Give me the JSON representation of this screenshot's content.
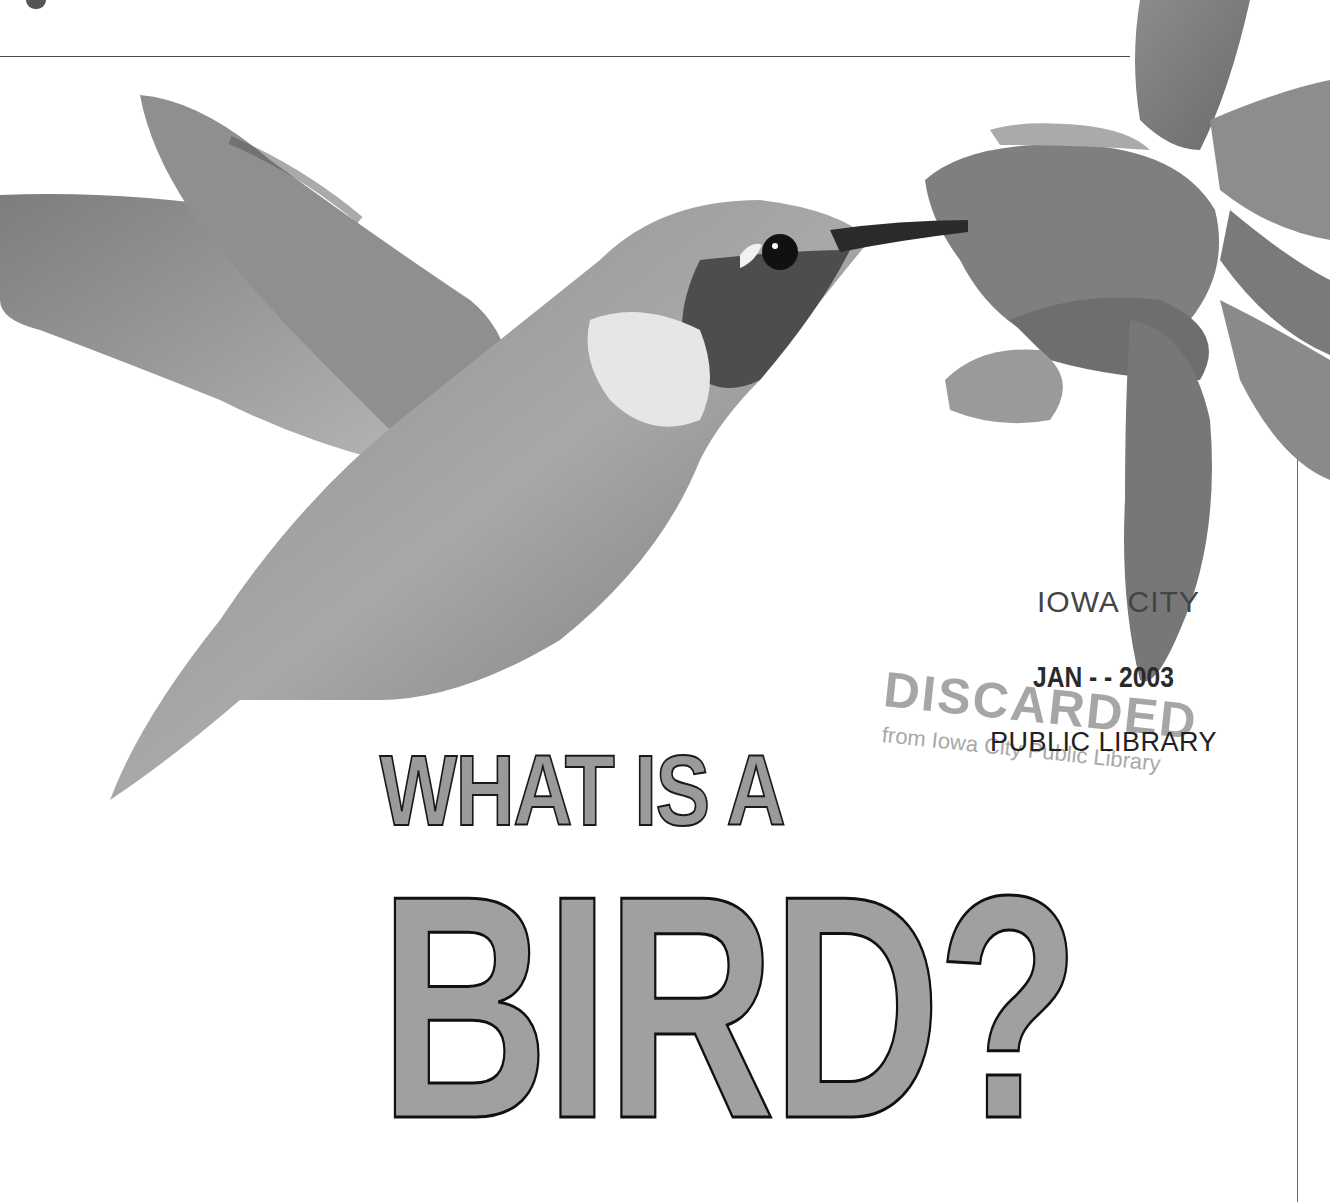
{
  "page": {
    "type": "book-cover",
    "background": "#ffffff"
  },
  "title": {
    "line1": "WHAT IS A",
    "line2": "BIRD?",
    "fill_color": "#9e9e9e",
    "outline_color": "#111111"
  },
  "illustration": {
    "subject": "hummingbird feeding from a flower",
    "elements": [
      "hummingbird",
      "flower"
    ]
  },
  "stamps": {
    "library_city": "IOWA CITY",
    "date": "JAN - - 2003",
    "library_name": "PUBLIC LIBRARY",
    "discarded": "DISCARDED",
    "discarded_from": "from Iowa City Public Library"
  }
}
